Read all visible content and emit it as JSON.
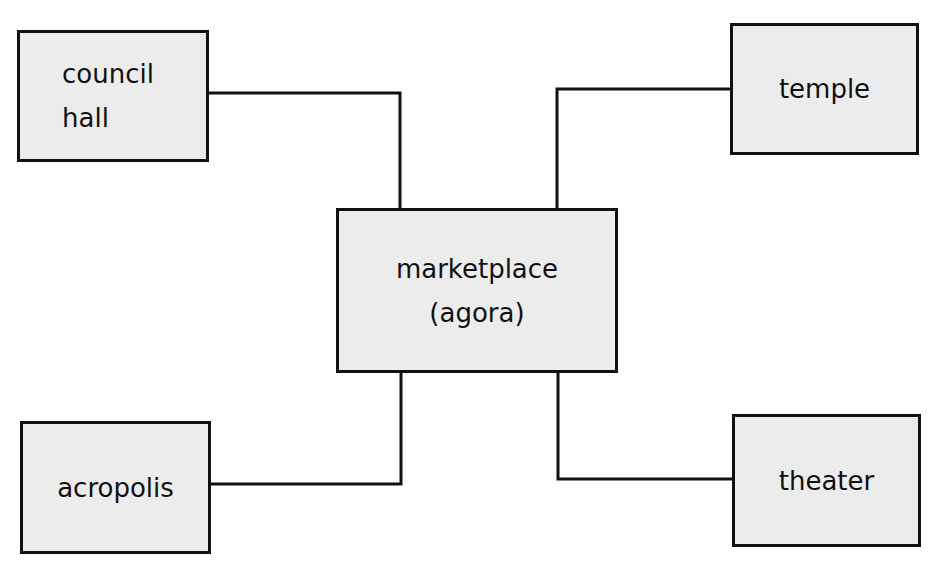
{
  "diagram": {
    "type": "hub-and-spoke",
    "colors": {
      "box_fill": "#ececec",
      "stroke": "#111111",
      "background": "#ffffff"
    },
    "center": {
      "id": "agora",
      "lines": [
        "marketplace",
        "(agora)"
      ]
    },
    "nodes": [
      {
        "id": "council-hall",
        "lines": [
          "council",
          "hall"
        ],
        "position": "top-left"
      },
      {
        "id": "temple",
        "lines": [
          "temple"
        ],
        "position": "top-right"
      },
      {
        "id": "acropolis",
        "lines": [
          "acropolis"
        ],
        "position": "bottom-left"
      },
      {
        "id": "theater",
        "lines": [
          "theater"
        ],
        "position": "bottom-right"
      }
    ],
    "edges": [
      {
        "from": "agora",
        "to": "council-hall"
      },
      {
        "from": "agora",
        "to": "temple"
      },
      {
        "from": "agora",
        "to": "acropolis"
      },
      {
        "from": "agora",
        "to": "theater"
      }
    ]
  }
}
